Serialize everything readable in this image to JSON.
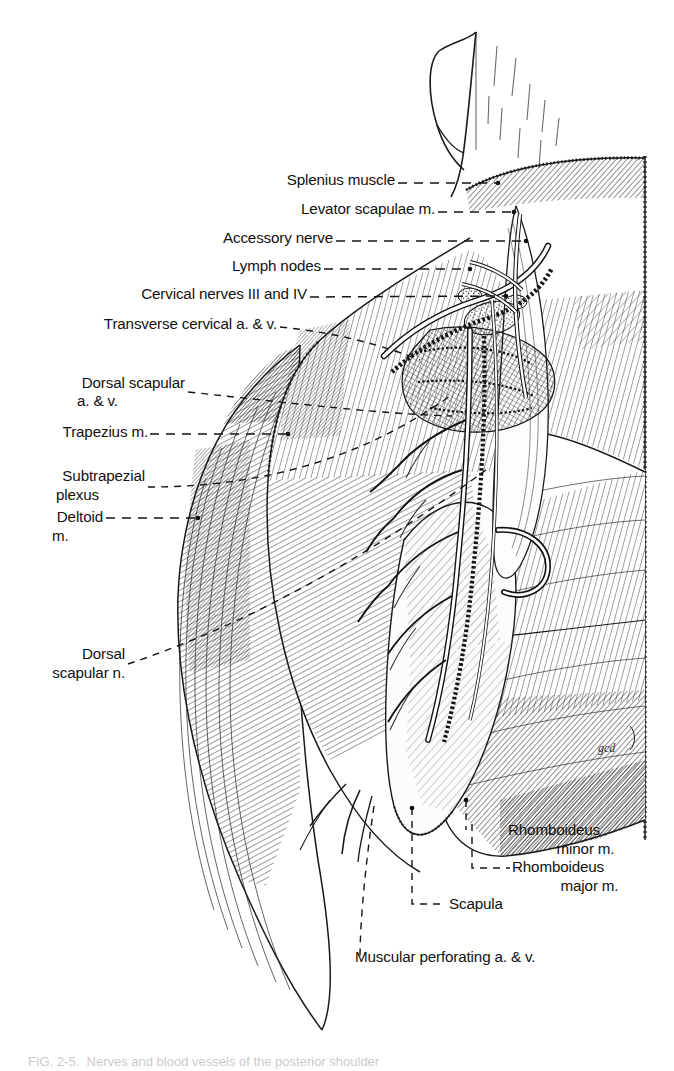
{
  "figure": {
    "type": "anatomical-illustration",
    "technique": "pen-and-ink line drawing",
    "artist_signature": "gcd",
    "caption": "FIG. 2-5.  Nerves and blood vessels of the posterior shoulder"
  },
  "labels": {
    "left_column": [
      {
        "id": "splenius",
        "text": "Splenius muscle",
        "sub": ""
      },
      {
        "id": "levator-scapulae",
        "text": "Levator scapulae m.",
        "sub": ""
      },
      {
        "id": "accessory-nerve",
        "text": "Accessory nerve",
        "sub": ""
      },
      {
        "id": "lymph-nodes",
        "text": "Lymph nodes",
        "sub": ""
      },
      {
        "id": "cervical-nerves",
        "text": "Cervical nerves III and IV",
        "sub": ""
      },
      {
        "id": "transverse-cervical",
        "text": "Transverse cervical a. & v.",
        "sub": ""
      },
      {
        "id": "dorsal-scapular-av",
        "text": "Dorsal scapular",
        "sub": "a. & v."
      },
      {
        "id": "trapezius",
        "text": "Trapezius m.",
        "sub": ""
      },
      {
        "id": "subtrapezial-plexus",
        "text": "Subtrapezial",
        "sub": "plexus"
      },
      {
        "id": "deltoid",
        "text": "Deltoid",
        "sub": "m."
      },
      {
        "id": "dorsal-scapular-n",
        "text": "Dorsal",
        "sub": "scapular n."
      }
    ],
    "right_column": [
      {
        "id": "rhomboideus-minor",
        "text": "Rhomboideus",
        "sub": "minor m."
      },
      {
        "id": "rhomboideus-major",
        "text": "Rhomboideus",
        "sub": "major m."
      },
      {
        "id": "scapula",
        "text": "Scapula",
        "sub": ""
      },
      {
        "id": "muscular-perforating",
        "text": "Muscular perforating a. & v.",
        "sub": ""
      }
    ]
  },
  "colors": {
    "ink": "#1a1a1a",
    "paper": "#ffffff",
    "leader": "#151515"
  }
}
